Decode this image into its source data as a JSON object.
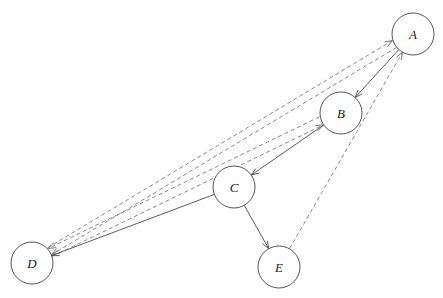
{
  "diagram": {
    "canvas": {
      "width": 443,
      "height": 298,
      "background": "#ffffff"
    },
    "style": {
      "node_fill": "#ffffff",
      "node_stroke": "#444444",
      "solid_edge_color": "#4a4a4a",
      "dashed_edge_color": "#6a6a6a",
      "label_color": "#1a1a1a",
      "node_radius": 21
    },
    "nodes": [
      {
        "id": "A",
        "label": "A",
        "cx": 413,
        "cy": 34,
        "r": 21
      },
      {
        "id": "B",
        "label": "B",
        "cx": 341,
        "cy": 113,
        "r": 21
      },
      {
        "id": "C",
        "label": "C",
        "cx": 234,
        "cy": 187,
        "r": 21
      },
      {
        "id": "D",
        "label": "D",
        "cx": 32,
        "cy": 263,
        "r": 21
      },
      {
        "id": "E",
        "label": "E",
        "cx": 279,
        "cy": 267,
        "r": 21
      }
    ],
    "edges": [
      {
        "id": "A-B",
        "from": "A",
        "to": "B",
        "style": "solid",
        "directed": true,
        "offset": 0
      },
      {
        "id": "B-C",
        "from": "B",
        "to": "C",
        "style": "solid",
        "directed": true,
        "offset": 0
      },
      {
        "id": "C-D",
        "from": "C",
        "to": "D",
        "style": "solid",
        "directed": true,
        "offset": 0
      },
      {
        "id": "C-E",
        "from": "C",
        "to": "E",
        "style": "solid",
        "directed": true,
        "offset": 0
      },
      {
        "id": "D-A",
        "from": "D",
        "to": "A",
        "style": "dashed",
        "directed": true,
        "offset": -5
      },
      {
        "id": "A-D",
        "from": "A",
        "to": "D",
        "style": "dashed",
        "directed": true,
        "offset": -3
      },
      {
        "id": "D-B",
        "from": "D",
        "to": "B",
        "style": "dashed",
        "directed": true,
        "offset": 3
      },
      {
        "id": "B-D",
        "from": "B",
        "to": "D",
        "style": "dashed",
        "directed": true,
        "offset": 6
      },
      {
        "id": "E-A",
        "from": "E",
        "to": "A",
        "style": "dashed",
        "directed": true,
        "offset": 0
      }
    ]
  }
}
